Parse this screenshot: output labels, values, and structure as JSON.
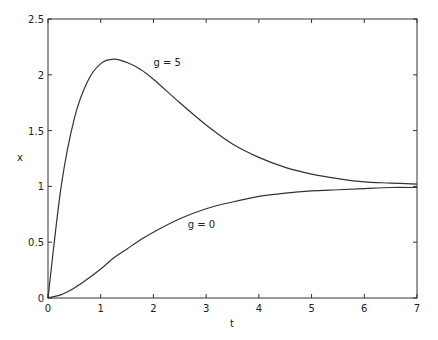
{
  "chart_data": {
    "type": "line",
    "title": "",
    "xlabel": "t",
    "ylabel": "x",
    "xlim": [
      0,
      7
    ],
    "ylim": [
      0,
      2.5
    ],
    "xticks": [
      "0",
      "1",
      "2",
      "3",
      "4",
      "5",
      "6",
      "7"
    ],
    "yticks": [
      "0",
      "0.5",
      "1",
      "1.5",
      "2",
      "2.5"
    ],
    "grid": false,
    "legend": "none (inline annotations)",
    "x": [
      0,
      0.25,
      0.5,
      0.75,
      1,
      1.25,
      1.5,
      1.75,
      2,
      2.5,
      3,
      3.5,
      4,
      4.5,
      5,
      5.5,
      6,
      6.5,
      7
    ],
    "series": [
      {
        "name": "g = 5",
        "values": [
          0,
          1.0,
          1.61,
          1.94,
          2.1,
          2.14,
          2.11,
          2.05,
          1.96,
          1.75,
          1.55,
          1.38,
          1.26,
          1.17,
          1.11,
          1.07,
          1.04,
          1.03,
          1.02
        ]
      },
      {
        "name": "g = 0",
        "values": [
          0,
          0.03,
          0.09,
          0.17,
          0.26,
          0.36,
          0.44,
          0.52,
          0.59,
          0.71,
          0.8,
          0.86,
          0.91,
          0.94,
          0.96,
          0.97,
          0.98,
          0.99,
          0.99
        ]
      }
    ],
    "annotations": [
      {
        "text": "g = 5",
        "x": 2.0,
        "y": 2.08
      },
      {
        "text": "g = 0",
        "x": 2.65,
        "y": 0.63
      }
    ]
  }
}
